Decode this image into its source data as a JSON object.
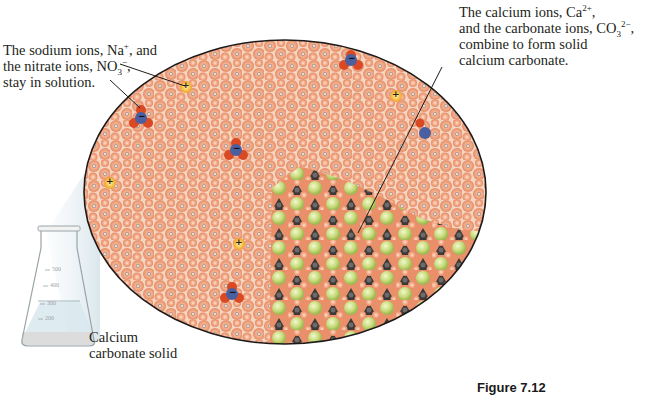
{
  "figure": {
    "caption": "Figure 7.12"
  },
  "labels": {
    "sodium_nitrate": {
      "line1_pre": "The sodium ions, Na",
      "line1_sup": "+",
      "line1_post": ", and",
      "line2_pre": "the nitrate ions, NO",
      "line2_sub": "3",
      "line2_sup": "−",
      "line2_post": ",",
      "line3": "stay in solution."
    },
    "calcium_carbonate": {
      "line1_pre": "The calcium ions, Ca",
      "line1_sup": "2+",
      "line1_post": ",",
      "line2_pre": "and the carbonate ions,  CO",
      "line2_sub": "3",
      "line2_sup": "2−",
      "line2_post": ",",
      "line3": "combine to form solid",
      "line4": "calcium carbonate."
    },
    "solid": {
      "line1": "Calcium",
      "line2": "carbonate solid"
    }
  },
  "flask": {
    "graduations": [
      "500",
      "400",
      "300",
      "200"
    ]
  },
  "colors": {
    "water_orange": "#f0a27c",
    "water_highlight": "#fbd2b8",
    "background_pale": "#f7e6d8",
    "sodium_ion": "#f7c548",
    "nitrate_blue": "#4a5fa0",
    "nitrate_red": "#d94a24",
    "calcium_green": "#c6dc7a",
    "carbon_dark": "#3a3838",
    "outline": "#1e1a1a",
    "beam": "#dbe8ee"
  },
  "ion_symbols": {
    "cation": "+",
    "anion": "−"
  }
}
